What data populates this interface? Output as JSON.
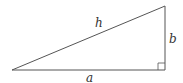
{
  "diagram": {
    "type": "right-triangle",
    "labels": {
      "hypotenuse": "h",
      "vertical_leg": "b",
      "horizontal_leg": "a"
    },
    "right_angle_marker": true,
    "stroke_color": "#555555"
  }
}
